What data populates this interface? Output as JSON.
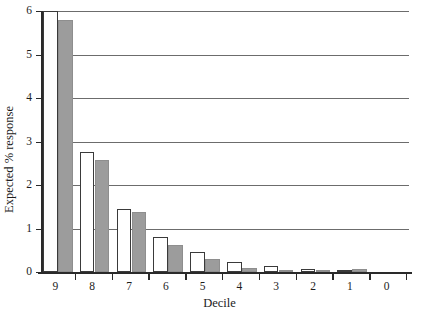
{
  "chart_data": {
    "type": "bar",
    "title": "",
    "subtitle": "",
    "xlabel": "Decile",
    "ylabel": "Expected % response",
    "categories": [
      "9",
      "8",
      "7",
      "6",
      "5",
      "4",
      "3",
      "2",
      "1",
      "0"
    ],
    "series": [
      {
        "name": "white",
        "color": "#ffffff",
        "values": [
          6.0,
          2.75,
          1.45,
          0.8,
          0.45,
          0.22,
          0.14,
          0.08,
          0.03,
          0.0
        ]
      },
      {
        "name": "gray",
        "color": "#9c9c9c",
        "values": [
          5.8,
          2.58,
          1.38,
          0.62,
          0.3,
          0.1,
          0.05,
          0.02,
          0.06,
          0.0
        ]
      }
    ],
    "ylim": [
      0,
      6
    ],
    "yticks": [
      0,
      1,
      2,
      3,
      4,
      5,
      6
    ],
    "ytick_labels": [
      "0",
      "1",
      "2",
      "3",
      "4",
      "5",
      "6"
    ],
    "xtick_labels": [
      "9",
      "8",
      "7",
      "6",
      "5",
      "4",
      "3",
      "2",
      "1",
      "0"
    ],
    "grid": true,
    "grid_axis": "y",
    "legend": "none",
    "legend_position": "none",
    "gridline_color": "#6c6c6c",
    "axis_color": "#2a2a2a"
  },
  "axes": {
    "y_title": "Expected % response",
    "x_title": "Decile"
  }
}
